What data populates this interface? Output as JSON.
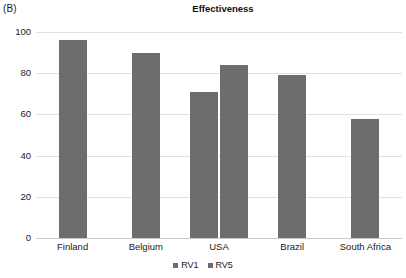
{
  "panel": {
    "label": "(B)"
  },
  "chart_data": {
    "type": "bar",
    "title": "Effectiveness",
    "xlabel": "",
    "ylabel": "",
    "ylim": [
      0,
      100
    ],
    "yticks": [
      0,
      20,
      40,
      60,
      80,
      100
    ],
    "ytick_labels": [
      "0",
      "20",
      "40",
      "60",
      "80",
      "100"
    ],
    "grid": true,
    "legend_position": "bottom-center",
    "categories": [
      "Finland",
      "Belgium",
      "USA",
      "Brazil",
      "South Africa"
    ],
    "series": [
      {
        "name": "RV1",
        "color": "#6d6d6d",
        "values": [
          96,
          90,
          71,
          79,
          58
        ]
      },
      {
        "name": "RV5",
        "color": "#6d6d6d",
        "values": [
          null,
          null,
          84,
          null,
          null
        ]
      }
    ],
    "legend": [
      {
        "label": "RV1",
        "color": "#6d6d6d"
      },
      {
        "label": "RV5",
        "color": "#6d6d6d"
      }
    ]
  },
  "colors": {
    "bar": "#6d6d6d",
    "gridline": "#e0e0e0",
    "zero_line": "#c9c9c9",
    "text": "#1a1a1a"
  }
}
